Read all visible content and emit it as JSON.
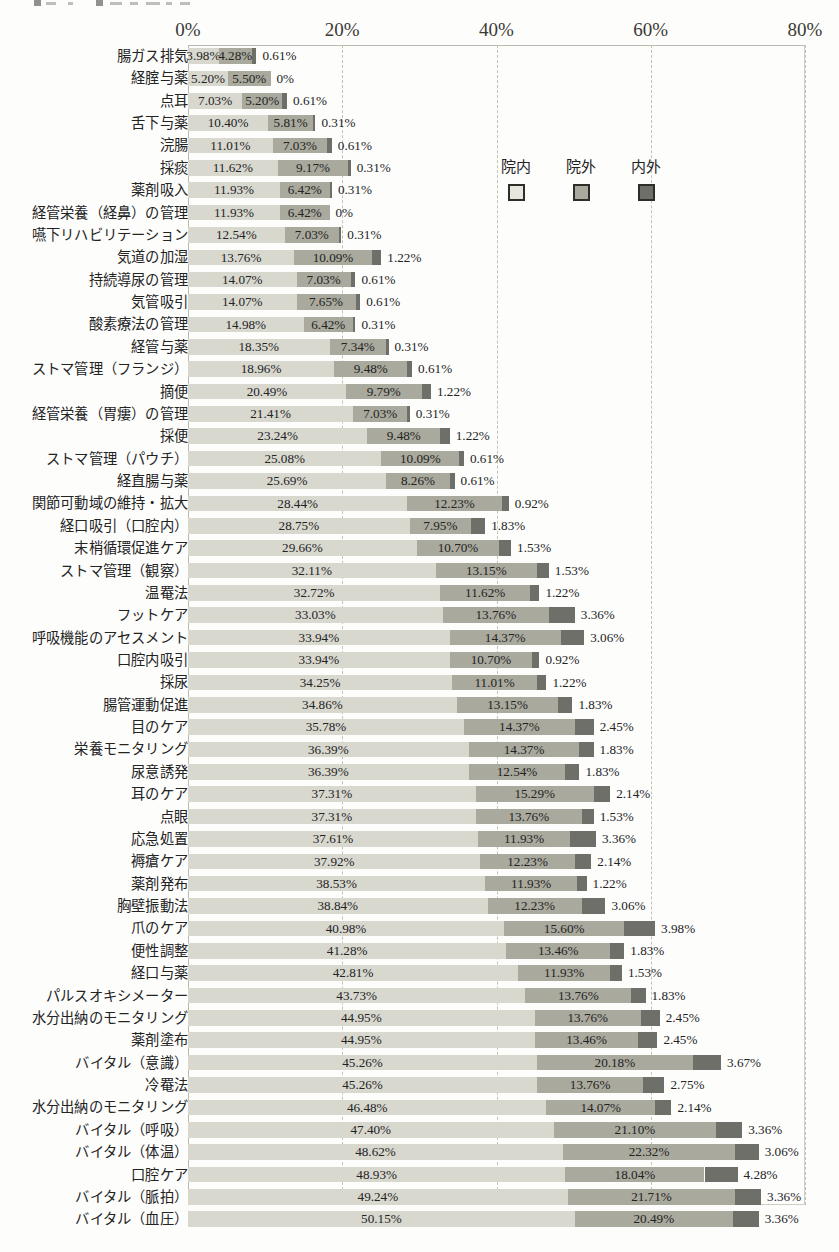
{
  "legend": {
    "items": [
      {
        "label": "院内",
        "key": "in",
        "color": "#e6e6de"
      },
      {
        "label": "院外",
        "key": "out",
        "color": "#a9a99d"
      },
      {
        "label": "内外",
        "key": "both",
        "color": "#6f6f69"
      }
    ]
  },
  "chart_data": {
    "type": "bar",
    "orientation": "horizontal",
    "stacked": true,
    "title": "",
    "xlabel": "",
    "ylabel": "",
    "xlim": [
      0,
      80
    ],
    "xticks": [
      "0%",
      "20%",
      "40%",
      "60%",
      "80%"
    ],
    "xtick_values": [
      0,
      20,
      40,
      60,
      80
    ],
    "grid": true,
    "grid_style": "dashed-vertical",
    "legend_position": "inside-upper-right",
    "value_label_suffix": "%",
    "series": [
      {
        "name": "院内",
        "color": "#d8d8cf"
      },
      {
        "name": "院外",
        "color": "#a9a99d"
      },
      {
        "name": "内外",
        "color": "#6f6f69"
      }
    ],
    "categories": [
      "腸ガス排気",
      "経腟与薬",
      "点耳",
      "舌下与薬",
      "浣腸",
      "採痰",
      "薬剤吸入",
      "経管栄養（経鼻）の管理",
      "嚥下リハビリテーション",
      "気道の加湿",
      "持続導尿の管理",
      "気管吸引",
      "酸素療法の管理",
      "経管与薬",
      "ストマ管理（フランジ）",
      "摘便",
      "経管栄養（胃瘻）の管理",
      "採便",
      "ストマ管理（パウチ）",
      "経直腸与薬",
      "関節可動域の維持・拡大",
      "経口吸引（口腔内）",
      "末梢循環促進ケア",
      "ストマ管理（観察）",
      "温罨法",
      "フットケア",
      "呼吸機能のアセスメント",
      "口腔内吸引",
      "採尿",
      "腸管運動促進",
      "目のケア",
      "栄養モニタリング",
      "尿意誘発",
      "耳のケア",
      "点眼",
      "応急処置",
      "褥瘡ケア",
      "薬剤発布",
      "胸壁振動法",
      "爪のケア",
      "便性調整",
      "経口与薬",
      "パルスオキシメーター",
      "水分出納のモニタリング",
      "薬剤塗布",
      "バイタル（意識）",
      "冷罨法",
      "水分出納のモニタリング",
      "バイタル（呼吸）",
      "バイタル（体温）",
      "口腔ケア",
      "バイタル（脈拍）",
      "バイタル（血圧）"
    ],
    "rows": [
      {
        "label": "腸ガス排気",
        "values": [
          3.98,
          4.28,
          0.61
        ],
        "labels": [
          "3.98%",
          "4.28%",
          "0.61%"
        ]
      },
      {
        "label": "経腟与薬",
        "values": [
          5.2,
          5.5,
          0.0
        ],
        "labels": [
          "5.20%",
          "5.50%",
          "0%"
        ]
      },
      {
        "label": "点耳",
        "values": [
          7.03,
          5.2,
          0.61
        ],
        "labels": [
          "7.03%",
          "5.20%",
          "0.61%"
        ]
      },
      {
        "label": "舌下与薬",
        "values": [
          10.4,
          5.81,
          0.31
        ],
        "labels": [
          "10.40%",
          "5.81%",
          "0.31%"
        ]
      },
      {
        "label": "浣腸",
        "values": [
          11.01,
          7.03,
          0.61
        ],
        "labels": [
          "11.01%",
          "7.03%",
          "0.61%"
        ]
      },
      {
        "label": "採痰",
        "values": [
          11.62,
          9.17,
          0.31
        ],
        "labels": [
          "11.62%",
          "9.17%",
          "0.31%"
        ]
      },
      {
        "label": "薬剤吸入",
        "values": [
          11.93,
          6.42,
          0.31
        ],
        "labels": [
          "11.93%",
          "6.42%",
          "0.31%"
        ]
      },
      {
        "label": "経管栄養（経鼻）の管理",
        "values": [
          11.93,
          6.42,
          0.0
        ],
        "labels": [
          "11.93%",
          "6.42%",
          "0%"
        ]
      },
      {
        "label": "嚥下リハビリテーション",
        "values": [
          12.54,
          7.03,
          0.31
        ],
        "labels": [
          "12.54%",
          "7.03%",
          "0.31%"
        ]
      },
      {
        "label": "気道の加湿",
        "values": [
          13.76,
          10.09,
          1.22
        ],
        "labels": [
          "13.76%",
          "10.09%",
          "1.22%"
        ]
      },
      {
        "label": "持続導尿の管理",
        "values": [
          14.07,
          7.03,
          0.61
        ],
        "labels": [
          "14.07%",
          "7.03%",
          "0.61%"
        ]
      },
      {
        "label": "気管吸引",
        "values": [
          14.07,
          7.65,
          0.61
        ],
        "labels": [
          "14.07%",
          "7.65%",
          "0.61%"
        ]
      },
      {
        "label": "酸素療法の管理",
        "values": [
          14.98,
          6.42,
          0.31
        ],
        "labels": [
          "14.98%",
          "6.42%",
          "0.31%"
        ]
      },
      {
        "label": "経管与薬",
        "values": [
          18.35,
          7.34,
          0.31
        ],
        "labels": [
          "18.35%",
          "7.34%",
          "0.31%"
        ]
      },
      {
        "label": "ストマ管理（フランジ）",
        "values": [
          18.96,
          9.48,
          0.61
        ],
        "labels": [
          "18.96%",
          "9.48%",
          "0.61%"
        ]
      },
      {
        "label": "摘便",
        "values": [
          20.49,
          9.79,
          1.22
        ],
        "labels": [
          "20.49%",
          "9.79%",
          "1.22%"
        ]
      },
      {
        "label": "経管栄養（胃瘻）の管理",
        "values": [
          21.41,
          7.03,
          0.31
        ],
        "labels": [
          "21.41%",
          "7.03%",
          "0.31%"
        ]
      },
      {
        "label": "採便",
        "values": [
          23.24,
          9.48,
          1.22
        ],
        "labels": [
          "23.24%",
          "9.48%",
          "1.22%"
        ]
      },
      {
        "label": "ストマ管理（パウチ）",
        "values": [
          25.08,
          10.09,
          0.61
        ],
        "labels": [
          "25.08%",
          "10.09%",
          "0.61%"
        ]
      },
      {
        "label": "経直腸与薬",
        "values": [
          25.69,
          8.26,
          0.61
        ],
        "labels": [
          "25.69%",
          "8.26%",
          "0.61%"
        ]
      },
      {
        "label": "関節可動域の維持・拡大",
        "values": [
          28.44,
          12.23,
          0.92
        ],
        "labels": [
          "28.44%",
          "12.23%",
          "0.92%"
        ]
      },
      {
        "label": "経口吸引（口腔内）",
        "values": [
          28.75,
          7.95,
          1.83
        ],
        "labels": [
          "28.75%",
          "7.95%",
          "1.83%"
        ]
      },
      {
        "label": "末梢循環促進ケア",
        "values": [
          29.66,
          10.7,
          1.53
        ],
        "labels": [
          "29.66%",
          "10.70%",
          "1.53%"
        ]
      },
      {
        "label": "ストマ管理（観察）",
        "values": [
          32.11,
          13.15,
          1.53
        ],
        "labels": [
          "32.11%",
          "13.15%",
          "1.53%"
        ]
      },
      {
        "label": "温罨法",
        "values": [
          32.72,
          11.62,
          1.22
        ],
        "labels": [
          "32.72%",
          "11.62%",
          "1.22%"
        ]
      },
      {
        "label": "フットケア",
        "values": [
          33.03,
          13.76,
          3.36
        ],
        "labels": [
          "33.03%",
          "13.76%",
          "3.36%"
        ]
      },
      {
        "label": "呼吸機能のアセスメント",
        "values": [
          33.94,
          14.37,
          3.06
        ],
        "labels": [
          "33.94%",
          "14.37%",
          "3.06%"
        ]
      },
      {
        "label": "口腔内吸引",
        "values": [
          33.94,
          10.7,
          0.92
        ],
        "labels": [
          "33.94%",
          "10.70%",
          "0.92%"
        ]
      },
      {
        "label": "採尿",
        "values": [
          34.25,
          11.01,
          1.22
        ],
        "labels": [
          "34.25%",
          "11.01%",
          "1.22%"
        ]
      },
      {
        "label": "腸管運動促進",
        "values": [
          34.86,
          13.15,
          1.83
        ],
        "labels": [
          "34.86%",
          "13.15%",
          "1.83%"
        ]
      },
      {
        "label": "目のケア",
        "values": [
          35.78,
          14.37,
          2.45
        ],
        "labels": [
          "35.78%",
          "14.37%",
          "2.45%"
        ]
      },
      {
        "label": "栄養モニタリング",
        "values": [
          36.39,
          14.37,
          1.83
        ],
        "labels": [
          "36.39%",
          "14.37%",
          "1.83%"
        ]
      },
      {
        "label": "尿意誘発",
        "values": [
          36.39,
          12.54,
          1.83
        ],
        "labels": [
          "36.39%",
          "12.54%",
          "1.83%"
        ]
      },
      {
        "label": "耳のケア",
        "values": [
          37.31,
          15.29,
          2.14
        ],
        "labels": [
          "37.31%",
          "15.29%",
          "2.14%"
        ]
      },
      {
        "label": "点眼",
        "values": [
          37.31,
          13.76,
          1.53
        ],
        "labels": [
          "37.31%",
          "13.76%",
          "1.53%"
        ]
      },
      {
        "label": "応急処置",
        "values": [
          37.61,
          11.93,
          3.36
        ],
        "labels": [
          "37.61%",
          "11.93%",
          "3.36%"
        ]
      },
      {
        "label": "褥瘡ケア",
        "values": [
          37.92,
          12.23,
          2.14
        ],
        "labels": [
          "37.92%",
          "12.23%",
          "2.14%"
        ]
      },
      {
        "label": "薬剤発布",
        "values": [
          38.53,
          11.93,
          1.22
        ],
        "labels": [
          "38.53%",
          "11.93%",
          "1.22%"
        ]
      },
      {
        "label": "胸壁振動法",
        "values": [
          38.84,
          12.23,
          3.06
        ],
        "labels": [
          "38.84%",
          "12.23%",
          "3.06%"
        ]
      },
      {
        "label": "爪のケア",
        "values": [
          40.98,
          15.6,
          3.98
        ],
        "labels": [
          "40.98%",
          "15.60%",
          "3.98%"
        ]
      },
      {
        "label": "便性調整",
        "values": [
          41.28,
          13.46,
          1.83
        ],
        "labels": [
          "41.28%",
          "13.46%",
          "1.83%"
        ]
      },
      {
        "label": "経口与薬",
        "values": [
          42.81,
          11.93,
          1.53
        ],
        "labels": [
          "42.81%",
          "11.93%",
          "1.53%"
        ]
      },
      {
        "label": "パルスオキシメーター",
        "values": [
          43.73,
          13.76,
          1.83
        ],
        "labels": [
          "43.73%",
          "13.76%",
          "1.83%"
        ]
      },
      {
        "label": "水分出納のモニタリング",
        "values": [
          44.95,
          13.76,
          2.45
        ],
        "labels": [
          "44.95%",
          "13.76%",
          "2.45%"
        ]
      },
      {
        "label": "薬剤塗布",
        "values": [
          44.95,
          13.46,
          2.45
        ],
        "labels": [
          "44.95%",
          "13.46%",
          "2.45%"
        ]
      },
      {
        "label": "バイタル（意識）",
        "values": [
          45.26,
          20.18,
          3.67
        ],
        "labels": [
          "45.26%",
          "20.18%",
          "3.67%"
        ]
      },
      {
        "label": "冷罨法",
        "values": [
          45.26,
          13.76,
          2.75
        ],
        "labels": [
          "45.26%",
          "13.76%",
          "2.75%"
        ]
      },
      {
        "label": "水分出納のモニタリング",
        "values": [
          46.48,
          14.07,
          2.14
        ],
        "labels": [
          "46.48%",
          "14.07%",
          "2.14%"
        ]
      },
      {
        "label": "バイタル（呼吸）",
        "values": [
          47.4,
          21.1,
          3.36
        ],
        "labels": [
          "47.40%",
          "21.10%",
          "3.36%"
        ]
      },
      {
        "label": "バイタル（体温）",
        "values": [
          48.62,
          22.32,
          3.06
        ],
        "labels": [
          "48.62%",
          "22.32%",
          "3.06%"
        ]
      },
      {
        "label": "口腔ケア",
        "values": [
          48.93,
          18.04,
          4.28
        ],
        "labels": [
          "48.93%",
          "18.04%",
          "4.28%"
        ]
      },
      {
        "label": "バイタル（脈拍）",
        "values": [
          49.24,
          21.71,
          3.36
        ],
        "labels": [
          "49.24%",
          "21.71%",
          "3.36%"
        ]
      },
      {
        "label": "バイタル（血圧）",
        "values": [
          50.15,
          20.49,
          3.36
        ],
        "labels": [
          "50.15%",
          "20.49%",
          "3.36%"
        ]
      }
    ]
  }
}
